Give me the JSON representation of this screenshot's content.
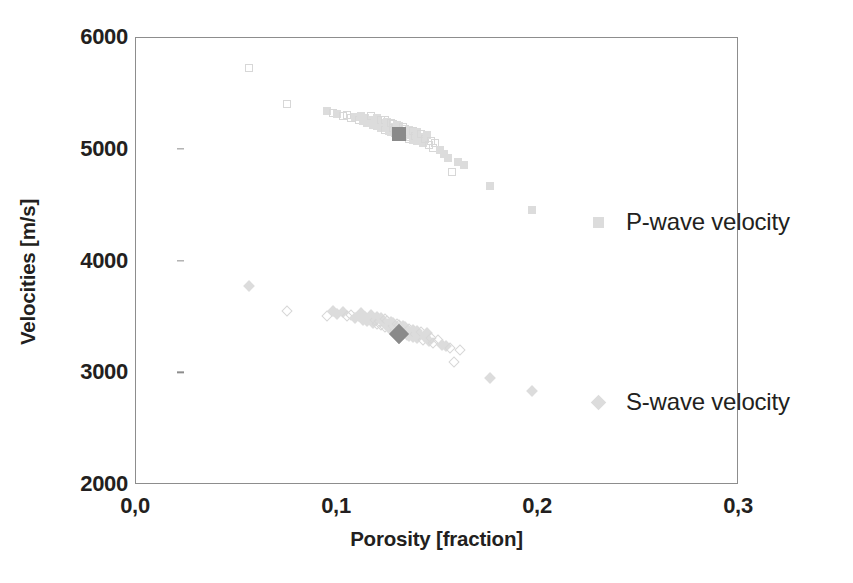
{
  "chart_data": {
    "type": "scatter",
    "title": "",
    "xlabel": "Porosity [fraction]",
    "ylabel": "Velocities [m/s]",
    "xlim": [
      0.0,
      0.3
    ],
    "ylim": [
      2000,
      6000
    ],
    "xticks": [
      "0,0",
      "0,1",
      "0,2",
      "0,3"
    ],
    "xtick_values": [
      0.0,
      0.1,
      0.2,
      0.3
    ],
    "yticks": [
      "2000",
      "3000",
      "4000",
      "5000",
      "6000"
    ],
    "ytick_values": [
      2000,
      3000,
      4000,
      5000,
      6000
    ],
    "grid": false,
    "legend_position": "right-inside-outside",
    "series": [
      {
        "name": "P-wave velocity",
        "marker": "square",
        "color": "#dcdcdc",
        "highlight_color": "#8a8a8a",
        "highlight_point": {
          "x": 0.131,
          "y": 5140
        },
        "points": [
          {
            "x": 0.056,
            "y": 5730
          },
          {
            "x": 0.075,
            "y": 5410
          },
          {
            "x": 0.095,
            "y": 5350
          },
          {
            "x": 0.098,
            "y": 5330
          },
          {
            "x": 0.1,
            "y": 5320
          },
          {
            "x": 0.103,
            "y": 5300
          },
          {
            "x": 0.105,
            "y": 5310
          },
          {
            "x": 0.107,
            "y": 5280
          },
          {
            "x": 0.109,
            "y": 5295
          },
          {
            "x": 0.111,
            "y": 5270
          },
          {
            "x": 0.112,
            "y": 5300
          },
          {
            "x": 0.113,
            "y": 5260
          },
          {
            "x": 0.114,
            "y": 5285
          },
          {
            "x": 0.115,
            "y": 5240
          },
          {
            "x": 0.116,
            "y": 5265
          },
          {
            "x": 0.117,
            "y": 5300
          },
          {
            "x": 0.118,
            "y": 5225
          },
          {
            "x": 0.119,
            "y": 5255
          },
          {
            "x": 0.12,
            "y": 5285
          },
          {
            "x": 0.12,
            "y": 5210
          },
          {
            "x": 0.121,
            "y": 5240
          },
          {
            "x": 0.122,
            "y": 5270
          },
          {
            "x": 0.122,
            "y": 5195
          },
          {
            "x": 0.123,
            "y": 5230
          },
          {
            "x": 0.124,
            "y": 5265
          },
          {
            "x": 0.124,
            "y": 5180
          },
          {
            "x": 0.125,
            "y": 5215
          },
          {
            "x": 0.125,
            "y": 5250
          },
          {
            "x": 0.126,
            "y": 5170
          },
          {
            "x": 0.126,
            "y": 5205
          },
          {
            "x": 0.127,
            "y": 5240
          },
          {
            "x": 0.127,
            "y": 5160
          },
          {
            "x": 0.128,
            "y": 5195
          },
          {
            "x": 0.128,
            "y": 5230
          },
          {
            "x": 0.129,
            "y": 5150
          },
          {
            "x": 0.129,
            "y": 5185
          },
          {
            "x": 0.13,
            "y": 5220
          },
          {
            "x": 0.13,
            "y": 5140
          },
          {
            "x": 0.131,
            "y": 5175
          },
          {
            "x": 0.131,
            "y": 5210
          },
          {
            "x": 0.132,
            "y": 5130
          },
          {
            "x": 0.132,
            "y": 5165
          },
          {
            "x": 0.133,
            "y": 5200
          },
          {
            "x": 0.133,
            "y": 5120
          },
          {
            "x": 0.134,
            "y": 5155
          },
          {
            "x": 0.134,
            "y": 5190
          },
          {
            "x": 0.135,
            "y": 5110
          },
          {
            "x": 0.135,
            "y": 5145
          },
          {
            "x": 0.136,
            "y": 5180
          },
          {
            "x": 0.136,
            "y": 5100
          },
          {
            "x": 0.137,
            "y": 5135
          },
          {
            "x": 0.138,
            "y": 5170
          },
          {
            "x": 0.138,
            "y": 5090
          },
          {
            "x": 0.139,
            "y": 5125
          },
          {
            "x": 0.14,
            "y": 5160
          },
          {
            "x": 0.14,
            "y": 5075
          },
          {
            "x": 0.141,
            "y": 5110
          },
          {
            "x": 0.142,
            "y": 5145
          },
          {
            "x": 0.143,
            "y": 5060
          },
          {
            "x": 0.144,
            "y": 5095
          },
          {
            "x": 0.145,
            "y": 5130
          },
          {
            "x": 0.146,
            "y": 5040
          },
          {
            "x": 0.147,
            "y": 5080
          },
          {
            "x": 0.148,
            "y": 5020
          },
          {
            "x": 0.149,
            "y": 5060
          },
          {
            "x": 0.151,
            "y": 5000
          },
          {
            "x": 0.153,
            "y": 4960
          },
          {
            "x": 0.155,
            "y": 4930
          },
          {
            "x": 0.157,
            "y": 4800
          },
          {
            "x": 0.16,
            "y": 4890
          },
          {
            "x": 0.163,
            "y": 4860
          },
          {
            "x": 0.176,
            "y": 4680
          },
          {
            "x": 0.197,
            "y": 4460
          }
        ]
      },
      {
        "name": "S-wave velocity",
        "marker": "diamond",
        "color": "#dcdcdc",
        "highlight_color": "#8a8a8a",
        "highlight_point": {
          "x": 0.131,
          "y": 3350
        },
        "points": [
          {
            "x": 0.056,
            "y": 3780
          },
          {
            "x": 0.075,
            "y": 3560
          },
          {
            "x": 0.095,
            "y": 3510
          },
          {
            "x": 0.098,
            "y": 3560
          },
          {
            "x": 0.1,
            "y": 3530
          },
          {
            "x": 0.103,
            "y": 3545
          },
          {
            "x": 0.105,
            "y": 3510
          },
          {
            "x": 0.107,
            "y": 3525
          },
          {
            "x": 0.109,
            "y": 3495
          },
          {
            "x": 0.111,
            "y": 3510
          },
          {
            "x": 0.112,
            "y": 3540
          },
          {
            "x": 0.113,
            "y": 3480
          },
          {
            "x": 0.114,
            "y": 3500
          },
          {
            "x": 0.115,
            "y": 3465
          },
          {
            "x": 0.116,
            "y": 3490
          },
          {
            "x": 0.117,
            "y": 3520
          },
          {
            "x": 0.118,
            "y": 3450
          },
          {
            "x": 0.119,
            "y": 3478
          },
          {
            "x": 0.12,
            "y": 3505
          },
          {
            "x": 0.12,
            "y": 3440
          },
          {
            "x": 0.121,
            "y": 3465
          },
          {
            "x": 0.122,
            "y": 3492
          },
          {
            "x": 0.122,
            "y": 3428
          },
          {
            "x": 0.123,
            "y": 3455
          },
          {
            "x": 0.124,
            "y": 3482
          },
          {
            "x": 0.124,
            "y": 3415
          },
          {
            "x": 0.125,
            "y": 3442
          },
          {
            "x": 0.125,
            "y": 3470
          },
          {
            "x": 0.126,
            "y": 3405
          },
          {
            "x": 0.126,
            "y": 3432
          },
          {
            "x": 0.127,
            "y": 3460
          },
          {
            "x": 0.127,
            "y": 3395
          },
          {
            "x": 0.128,
            "y": 3422
          },
          {
            "x": 0.128,
            "y": 3450
          },
          {
            "x": 0.129,
            "y": 3385
          },
          {
            "x": 0.129,
            "y": 3412
          },
          {
            "x": 0.13,
            "y": 3440
          },
          {
            "x": 0.13,
            "y": 3375
          },
          {
            "x": 0.131,
            "y": 3402
          },
          {
            "x": 0.131,
            "y": 3430
          },
          {
            "x": 0.132,
            "y": 3365
          },
          {
            "x": 0.132,
            "y": 3392
          },
          {
            "x": 0.133,
            "y": 3420
          },
          {
            "x": 0.133,
            "y": 3355
          },
          {
            "x": 0.134,
            "y": 3382
          },
          {
            "x": 0.134,
            "y": 3410
          },
          {
            "x": 0.135,
            "y": 3345
          },
          {
            "x": 0.135,
            "y": 3372
          },
          {
            "x": 0.136,
            "y": 3400
          },
          {
            "x": 0.136,
            "y": 3335
          },
          {
            "x": 0.137,
            "y": 3362
          },
          {
            "x": 0.138,
            "y": 3390
          },
          {
            "x": 0.138,
            "y": 3325
          },
          {
            "x": 0.139,
            "y": 3352
          },
          {
            "x": 0.14,
            "y": 3380
          },
          {
            "x": 0.14,
            "y": 3312
          },
          {
            "x": 0.141,
            "y": 3340
          },
          {
            "x": 0.142,
            "y": 3368
          },
          {
            "x": 0.143,
            "y": 3300
          },
          {
            "x": 0.144,
            "y": 3328
          },
          {
            "x": 0.145,
            "y": 3356
          },
          {
            "x": 0.146,
            "y": 3288
          },
          {
            "x": 0.147,
            "y": 3316
          },
          {
            "x": 0.148,
            "y": 3270
          },
          {
            "x": 0.15,
            "y": 3300
          },
          {
            "x": 0.152,
            "y": 3255
          },
          {
            "x": 0.154,
            "y": 3240
          },
          {
            "x": 0.156,
            "y": 3225
          },
          {
            "x": 0.158,
            "y": 3100
          },
          {
            "x": 0.161,
            "y": 3205
          },
          {
            "x": 0.176,
            "y": 2960
          },
          {
            "x": 0.197,
            "y": 2840
          }
        ]
      }
    ]
  },
  "legend": {
    "entries": [
      {
        "label": "P-wave velocity",
        "marker": "square"
      },
      {
        "label": "S-wave velocity",
        "marker": "diamond"
      }
    ]
  }
}
